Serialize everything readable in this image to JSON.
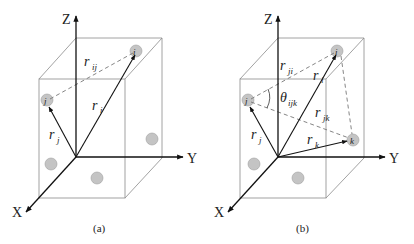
{
  "panels": [
    {
      "caption": "(a)",
      "axes": {
        "x": "X",
        "y": "Y",
        "z": "Z"
      },
      "atoms": [
        "i",
        "j"
      ],
      "vectors": [
        {
          "name": "r_i",
          "base": "r",
          "sub": "i"
        },
        {
          "name": "r_j",
          "base": "r",
          "sub": "j"
        },
        {
          "name": "r_ij",
          "base": "r",
          "sub": "ij"
        }
      ]
    },
    {
      "caption": "(b)",
      "axes": {
        "x": "X",
        "y": "Y",
        "z": "Z"
      },
      "atoms": [
        "i",
        "j",
        "k"
      ],
      "vectors": [
        {
          "name": "r_ji",
          "base": "r",
          "sub": "ji"
        },
        {
          "name": "r_i",
          "base": "r",
          "sub": "i"
        },
        {
          "name": "r_jk",
          "base": "r",
          "sub": "jk"
        },
        {
          "name": "r_j",
          "base": "r",
          "sub": "j"
        },
        {
          "name": "r_k",
          "base": "r",
          "sub": "k"
        }
      ],
      "angle": {
        "base": "θ",
        "sub": "ijk"
      }
    }
  ],
  "colors": {
    "axis": "#111111",
    "box": "#7a7a7a",
    "atom_fill": "#c4c4c4",
    "atom_stroke": "#9a9a9a",
    "dashed": "#777777"
  }
}
